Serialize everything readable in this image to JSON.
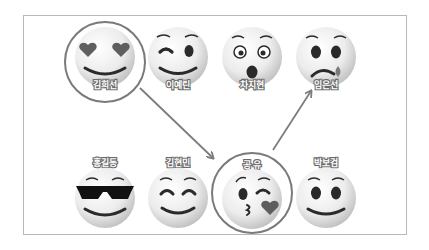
{
  "colors": {
    "frame_border": "#b8b8b8",
    "highlight_ring": "#7a7a7a",
    "arrow": "#7d7d7d",
    "face_light": "#f7f7f7",
    "face_dark": "#c9c9c9",
    "feature_dark": "#2a2a2a",
    "heart": "#5e5e5e"
  },
  "people": [
    {
      "name": "김희선",
      "emoji": "heart-eyes-face-icon",
      "row": "top",
      "highlighted": true
    },
    {
      "name": "이예린",
      "emoji": "winking-face-icon",
      "row": "top",
      "highlighted": false
    },
    {
      "name": "차지현",
      "emoji": "astonished-face-icon",
      "row": "top",
      "highlighted": false
    },
    {
      "name": "임은선",
      "emoji": "crying-face-icon",
      "row": "top",
      "highlighted": false
    },
    {
      "name": "홍길동",
      "emoji": "sunglasses-face-icon",
      "row": "bottom",
      "highlighted": false
    },
    {
      "name": "김현민",
      "emoji": "smiling-closed-eyes-face-icon",
      "row": "bottom",
      "highlighted": false
    },
    {
      "name": "공 유",
      "emoji": "kissing-face-icon",
      "row": "bottom",
      "highlighted": true
    },
    {
      "name": "박보검",
      "emoji": "smiling-face-icon",
      "row": "bottom",
      "highlighted": false
    }
  ],
  "arrows": [
    {
      "from": "김희선",
      "to": "공 유"
    },
    {
      "from": "공 유",
      "to": "임은선"
    }
  ]
}
